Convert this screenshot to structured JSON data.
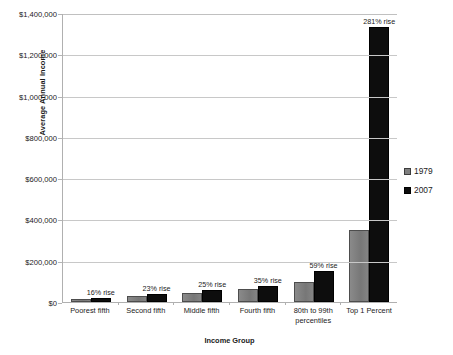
{
  "chart_data": {
    "type": "bar",
    "title": "",
    "xlabel": "Income Group",
    "ylabel": "Average Annual Income",
    "ylim": [
      0,
      1400000
    ],
    "ytick_labels": [
      "$1,400,000",
      "$1,200,000",
      "$1,000,000",
      "$800,000",
      "$600,000",
      "$400,000",
      "$200,000",
      "$0"
    ],
    "ytick_values": [
      1400000,
      1200000,
      1000000,
      800000,
      600000,
      400000,
      200000,
      0
    ],
    "grid": true,
    "legend_position": "right",
    "categories": [
      "Poorest fifth",
      "Second fifth",
      "Middle fifth",
      "Fourth fifth",
      "80th to 99th percentiles",
      "Top 1 Percent"
    ],
    "series": [
      {
        "name": "1979",
        "color": "#7f7f7f",
        "values": [
          15000,
          30000,
          45000,
          62000,
          95000,
          350000
        ]
      },
      {
        "name": "2007",
        "color": "#0d0d0d",
        "values": [
          18000,
          37000,
          56000,
          78000,
          150000,
          1330000
        ]
      }
    ],
    "annotations": [
      "16% rise",
      "23% rise",
      "25% rise",
      "35% rise",
      "59% rise",
      "281% rise"
    ]
  }
}
